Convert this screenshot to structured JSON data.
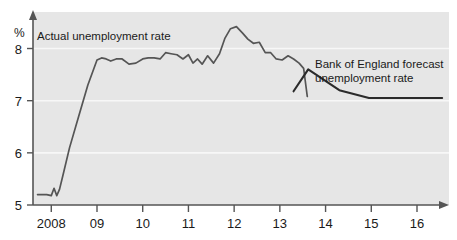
{
  "chart_data": {
    "type": "line",
    "title": "",
    "subtitle": "",
    "xlabel": "",
    "ylabel": "%",
    "ylim": [
      5,
      8.7
    ],
    "xlim": [
      2007.6,
      2016.7
    ],
    "grid": true,
    "legend_position": "inline-annotation",
    "y_ticks": [
      "5",
      "6",
      "7",
      "8"
    ],
    "y_tick_values": [
      5,
      6,
      7,
      8
    ],
    "x_ticks": [
      "2008",
      "09",
      "10",
      "11",
      "12",
      "13",
      "14",
      "15",
      "16"
    ],
    "x_tick_values": [
      2008,
      2009,
      2010,
      2011,
      2012,
      2013,
      2014,
      2015,
      2016
    ],
    "plot_background": "#e6e6e6",
    "axis_color": "#555555",
    "gridline_color": "#f7f7f7",
    "series": [
      {
        "name": "Actual unemployment rate",
        "color": "#555555",
        "annotation": "Actual unemployment rate",
        "x": [
          2007.7,
          2007.8,
          2007.9,
          2008.0,
          2008.06,
          2008.12,
          2008.18,
          2008.25,
          2008.4,
          2008.6,
          2008.8,
          2009.0,
          2009.1,
          2009.2,
          2009.3,
          2009.42,
          2009.55,
          2009.7,
          2009.85,
          2010.0,
          2010.12,
          2010.25,
          2010.38,
          2010.5,
          2010.62,
          2010.75,
          2010.88,
          2011.0,
          2011.1,
          2011.2,
          2011.3,
          2011.42,
          2011.55,
          2011.68,
          2011.8,
          2011.92,
          2012.05,
          2012.18,
          2012.3,
          2012.42,
          2012.55,
          2012.68,
          2012.8,
          2012.92,
          2013.05,
          2013.18,
          2013.3,
          2013.42,
          2013.52,
          2013.6
        ],
        "y": [
          5.2,
          5.2,
          5.2,
          5.18,
          5.32,
          5.18,
          5.3,
          5.55,
          6.1,
          6.7,
          7.3,
          7.78,
          7.82,
          7.8,
          7.76,
          7.8,
          7.8,
          7.7,
          7.72,
          7.8,
          7.82,
          7.82,
          7.8,
          7.92,
          7.9,
          7.88,
          7.8,
          7.88,
          7.72,
          7.8,
          7.7,
          7.86,
          7.72,
          7.9,
          8.2,
          8.38,
          8.42,
          8.3,
          8.18,
          8.1,
          8.12,
          7.92,
          7.92,
          7.8,
          7.78,
          7.86,
          7.8,
          7.72,
          7.62,
          7.08
        ]
      },
      {
        "name": "Bank of England forecast unemployment rate",
        "color": "#2b2b2b",
        "annotation_line1": "Bank of England forecast",
        "annotation_line2": "unemployment rate",
        "x": [
          2013.3,
          2013.62,
          2014.3,
          2014.95,
          2016.55
        ],
        "y": [
          7.18,
          7.6,
          7.2,
          7.05,
          7.05
        ]
      }
    ],
    "annotations": [
      {
        "text": "Actual unemployment rate",
        "x_px": 37,
        "y_px": 40
      },
      {
        "text": "Bank of England forecast",
        "x_px": 315,
        "y_px": 68
      },
      {
        "text": "unemployment rate",
        "x_px": 315,
        "y_px": 82
      }
    ]
  }
}
